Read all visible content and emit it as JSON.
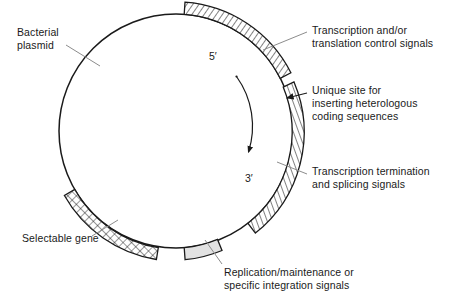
{
  "figure": {
    "type": "circular-plasmid-map",
    "background_color": "#ffffff",
    "line_color": "#1a1a1a"
  },
  "plasmid": {
    "center": {
      "x": 176,
      "y": 131
    },
    "radius": 117,
    "backbone_label": "Bacterial plasmid"
  },
  "labels": {
    "bacterial_plasmid": "Bacterial\nplasmid",
    "transcription_control": "Transcription and/or\ntranslation control signals",
    "unique_site": "Unique site for\ninserting heterologous\ncoding sequences",
    "transcription_termination": "Transcription termination\nand splicing signals",
    "selectable_gene": "Selectable gene",
    "replication": "Replication/maintenance or\nspecific integration signals",
    "five_prime": "5′",
    "three_prime": "3′"
  },
  "segments": [
    {
      "name": "transcription-control-signals",
      "label": "Transcription and/or translation control signals",
      "fill": "diagonal-hatch",
      "start_angle_deg": -86,
      "end_angle_deg": -27,
      "color": "#1a1a1a"
    },
    {
      "name": "transcription-termination-signals",
      "label": "Transcription termination and splicing signals",
      "fill": "diagonal-hatch",
      "start_angle_deg": -21,
      "end_angle_deg": 52,
      "color": "#1a1a1a"
    },
    {
      "name": "selectable-gene",
      "label": "Selectable gene",
      "fill": "cross-hatch",
      "start_angle_deg": 150,
      "end_angle_deg": 99,
      "color": "#1a1a1a"
    },
    {
      "name": "replication-maintenance-signals",
      "label": "Replication/maintenance or specific integration signals",
      "fill": "solid-light-gray",
      "start_angle_deg": 86,
      "end_angle_deg": 69,
      "color": "#e2e2e2"
    }
  ],
  "markers": {
    "unique_site": {
      "name": "unique-restriction-site",
      "angle_deg": -24,
      "description": "Gap between the two hatched arcs, indicated by arrowhead"
    },
    "direction_arrow": {
      "name": "transcription-direction-arrow",
      "from_label": "5′",
      "to_label": "3′",
      "direction": "clockwise"
    }
  },
  "colors": {
    "stroke": "#1a1a1a",
    "leader_line": "#8c8c8c",
    "gray_fill": "#e2e2e2",
    "text": "#1a1a1a",
    "background": "#ffffff"
  }
}
